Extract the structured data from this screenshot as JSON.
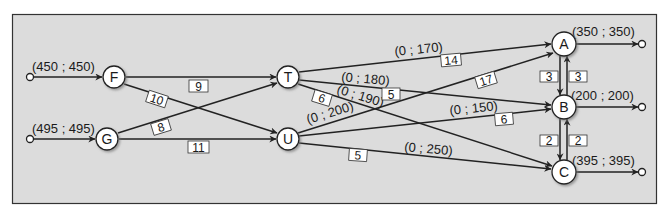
{
  "diagram": {
    "type": "transportation network",
    "colors": {
      "panel_bg": "#dcdcdc",
      "frame": "#333333",
      "edge": "#222222",
      "node_fill": "#ffffff",
      "label_box_fill": "#ffffff"
    },
    "nodes": [
      {
        "id": "F",
        "label": "F",
        "supply": "(450 ; 450)"
      },
      {
        "id": "G",
        "label": "G",
        "supply": "(495 ; 495)"
      },
      {
        "id": "T",
        "label": "T"
      },
      {
        "id": "U",
        "label": "U"
      },
      {
        "id": "A",
        "label": "A",
        "demand": "(350 ; 350)"
      },
      {
        "id": "B",
        "label": "B",
        "demand": "(200 ; 200)"
      },
      {
        "id": "C",
        "label": "C",
        "demand": "(395 ; 395)"
      }
    ],
    "edges": [
      {
        "from": "F",
        "to": "T",
        "cost": "9"
      },
      {
        "from": "F",
        "to": "U",
        "cost": "10"
      },
      {
        "from": "G",
        "to": "T",
        "cost": "8"
      },
      {
        "from": "G",
        "to": "U",
        "cost": "11"
      },
      {
        "from": "T",
        "to": "A",
        "cost": "14",
        "bounds": "(0 ; 170)"
      },
      {
        "from": "T",
        "to": "B",
        "cost": "5",
        "bounds": "(0 ; 180)"
      },
      {
        "from": "T",
        "to": "C",
        "cost": "6",
        "bounds": "(0 ; 190)"
      },
      {
        "from": "U",
        "to": "A",
        "cost": "17",
        "bounds": "(0 ; 200)"
      },
      {
        "from": "U",
        "to": "B",
        "cost": "6",
        "bounds": "(0 ; 150)"
      },
      {
        "from": "U",
        "to": "C",
        "cost": "5",
        "bounds": "(0 ; 250)"
      },
      {
        "from": "A",
        "to": "B",
        "cost": "3"
      },
      {
        "from": "B",
        "to": "A",
        "cost": "3"
      },
      {
        "from": "B",
        "to": "C",
        "cost": "2"
      },
      {
        "from": "C",
        "to": "B",
        "cost": "2"
      }
    ]
  }
}
